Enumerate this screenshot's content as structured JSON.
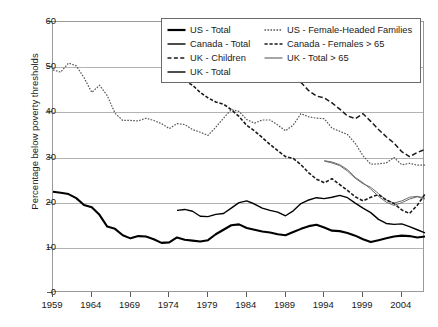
{
  "chart_data": {
    "type": "line",
    "title": "",
    "subtitle": "",
    "xlabel": "",
    "ylabel": "Percentage below poverty thresholds",
    "xlim": [
      1959,
      2007
    ],
    "ylim": [
      0,
      60
    ],
    "ytick_labels": [
      "0",
      "10",
      "20",
      "30",
      "40",
      "50",
      "60"
    ],
    "ytick_values": [
      0,
      10,
      20,
      30,
      40,
      50,
      60
    ],
    "xtick_labels": [
      "1959",
      "1964",
      "1969",
      "1974",
      "1979",
      "1984",
      "1989",
      "1994",
      "1999",
      "2004"
    ],
    "xtick_values": [
      1959,
      1964,
      1969,
      1974,
      1979,
      1984,
      1989,
      1994,
      1999,
      2004
    ],
    "grid": "horizontal",
    "legend_position": "top-center",
    "series": [
      {
        "name": "US - Total",
        "style": "solid",
        "color": "#000000",
        "width": 2.1,
        "x": [
          1959,
          1960,
          1961,
          1962,
          1963,
          1964,
          1965,
          1966,
          1967,
          1968,
          1969,
          1970,
          1971,
          1972,
          1973,
          1974,
          1975,
          1976,
          1977,
          1978,
          1979,
          1980,
          1981,
          1982,
          1983,
          1984,
          1985,
          1986,
          1987,
          1988,
          1989,
          1990,
          1991,
          1992,
          1993,
          1994,
          1995,
          1996,
          1997,
          1998,
          1999,
          2000,
          2001,
          2002,
          2003,
          2004,
          2005,
          2006,
          2007
        ],
        "values": [
          22.4,
          22.2,
          21.9,
          21.0,
          19.5,
          19.0,
          17.3,
          14.7,
          14.2,
          12.8,
          12.1,
          12.6,
          12.5,
          11.9,
          11.1,
          11.2,
          12.3,
          11.8,
          11.6,
          11.4,
          11.7,
          13.0,
          14.0,
          15.0,
          15.2,
          14.4,
          14.0,
          13.6,
          13.4,
          13.0,
          12.8,
          13.5,
          14.2,
          14.8,
          15.1,
          14.5,
          13.8,
          13.7,
          13.3,
          12.7,
          11.9,
          11.3,
          11.7,
          12.1,
          12.5,
          12.7,
          12.6,
          12.3,
          12.5
        ]
      },
      {
        "name": "Canada - Total",
        "style": "solid",
        "color": "#000000",
        "width": 1.4,
        "x": [
          1975,
          1976,
          1977,
          1978,
          1979,
          1980,
          1981,
          1982,
          1983,
          1984,
          1985,
          1986,
          1987,
          1988,
          1989,
          1990,
          1991,
          1992,
          1993,
          1994,
          1995,
          1996,
          1997,
          1998,
          1999,
          2000,
          2001,
          2002,
          2003,
          2004,
          2005,
          2006,
          2007
        ],
        "values": [
          18.3,
          18.5,
          18.1,
          17.0,
          16.9,
          17.4,
          17.6,
          18.8,
          20.0,
          20.4,
          19.7,
          18.8,
          18.3,
          17.9,
          17.1,
          18.2,
          19.8,
          20.6,
          21.1,
          20.9,
          21.2,
          21.6,
          21.1,
          19.9,
          18.8,
          17.8,
          16.3,
          15.4,
          15.2,
          15.3,
          14.7,
          14.0,
          13.3
        ]
      },
      {
        "name": "UK - Children",
        "style": "dashed",
        "color": "#1a1a1a",
        "width": 1.5,
        "x": [
          1990,
          1991,
          1992,
          1993,
          1994,
          1995,
          1996,
          1997,
          1998,
          1999,
          2000,
          2001,
          2002,
          2003,
          2004,
          2005,
          2006,
          2007
        ],
        "values": [
          47.0,
          46.6,
          44.8,
          43.6,
          43.2,
          42.1,
          40.7,
          39.2,
          38.6,
          39.7,
          38.0,
          36.2,
          34.6,
          33.2,
          31.3,
          30.2,
          31.1,
          31.8
        ]
      },
      {
        "name": "UK - Total",
        "style": "solid",
        "color": "#6b6b6b",
        "width": 1.0,
        "x": [
          1994,
          1995,
          1996,
          1997,
          1998,
          1999,
          2000,
          2001,
          2002,
          2003,
          2004,
          2005,
          2006,
          2007
        ],
        "values": [
          29.2,
          28.8,
          28.2,
          27.0,
          25.4,
          24.2,
          23.4,
          22.0,
          20.6,
          19.9,
          20.4,
          21.2,
          21.4,
          21.0
        ]
      },
      {
        "name": "US - Female-Headed Families",
        "style": "dotted-fine",
        "color": "#555555",
        "width": 1.2,
        "x": [
          1959,
          1960,
          1961,
          1962,
          1963,
          1964,
          1965,
          1966,
          1967,
          1968,
          1969,
          1970,
          1971,
          1972,
          1973,
          1974,
          1975,
          1976,
          1977,
          1978,
          1979,
          1980,
          1981,
          1982,
          1983,
          1984,
          1985,
          1986,
          1987,
          1988,
          1989,
          1990,
          1991,
          1992,
          1993,
          1994,
          1995,
          1996,
          1997,
          1998,
          1999,
          2000,
          2001,
          2002,
          2003,
          2004,
          2005,
          2006,
          2007
        ],
        "values": [
          49.4,
          48.9,
          50.9,
          50.3,
          47.7,
          44.4,
          46.0,
          43.7,
          39.8,
          38.2,
          38.2,
          38.1,
          38.7,
          38.2,
          37.5,
          36.4,
          37.5,
          37.3,
          36.2,
          35.6,
          34.9,
          36.7,
          38.7,
          40.6,
          40.2,
          38.4,
          37.6,
          38.3,
          38.3,
          37.2,
          35.9,
          37.2,
          39.7,
          39.0,
          38.7,
          38.6,
          36.5,
          35.8,
          35.1,
          33.1,
          30.4,
          28.5,
          28.6,
          28.8,
          30.0,
          28.4,
          28.7,
          28.3,
          28.3
        ]
      },
      {
        "name": "Canada - Females > 65",
        "style": "dash-dot",
        "color": "#1a1a1a",
        "width": 1.6,
        "x": [
          1976,
          1977,
          1978,
          1979,
          1980,
          1981,
          1982,
          1983,
          1984,
          1985,
          1986,
          1987,
          1988,
          1989,
          1990,
          1991,
          1992,
          1993,
          1994,
          1995,
          1996,
          1997,
          1998,
          1999,
          2000,
          2001,
          2002,
          2003,
          2004,
          2005,
          2006,
          2007
        ],
        "values": [
          47.0,
          46.0,
          44.4,
          43.2,
          42.3,
          41.8,
          40.6,
          39.1,
          37.1,
          35.9,
          34.4,
          32.9,
          31.5,
          30.2,
          29.8,
          28.4,
          26.6,
          25.2,
          24.4,
          25.3,
          24.0,
          22.7,
          21.3,
          20.4,
          21.2,
          21.8,
          20.6,
          19.8,
          18.4,
          17.6,
          19.4,
          21.9
        ]
      },
      {
        "name": "UK - Total > 65",
        "style": "solid",
        "color": "#6b6b6b",
        "width": 1.0,
        "x": [
          1994,
          1995,
          1996,
          1997,
          1998,
          1999,
          2000,
          2001,
          2002,
          2003,
          2004,
          2005,
          2006,
          2007
        ],
        "values": [
          29.3,
          29.0,
          28.4,
          27.3,
          25.6,
          24.4,
          23.0,
          21.4,
          20.1,
          19.4,
          20.0,
          20.8,
          21.3,
          20.8
        ]
      }
    ]
  },
  "legend": {
    "entries": [
      {
        "label": "US - Total",
        "style": "solid-thick",
        "color": "#000000"
      },
      {
        "label": "US - Female-Headed Families",
        "style": "dotted-fine",
        "color": "#555555"
      },
      {
        "label": "Canada - Total",
        "style": "solid",
        "color": "#000000"
      },
      {
        "label": "Canada - Females > 65",
        "style": "dash-dot",
        "color": "#1a1a1a"
      },
      {
        "label": "UK - Children",
        "style": "dashed",
        "color": "#1a1a1a"
      },
      {
        "label": "UK - Total > 65",
        "style": "solid-gray",
        "color": "#6b6b6b"
      },
      {
        "label": "UK - Total",
        "style": "solid",
        "color": "#000000"
      }
    ]
  },
  "colors": {
    "axis": "#9a9a9a",
    "grid": "#b3b3b3",
    "text": "#1a1a1a",
    "series_black": "#000000",
    "series_gray": "#6b6b6b",
    "series_dot": "#555555"
  }
}
